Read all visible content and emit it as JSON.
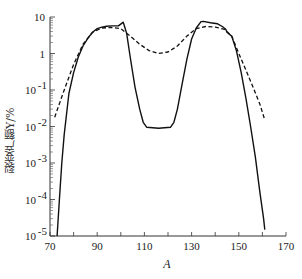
{
  "chart_data": {
    "type": "line",
    "title": "",
    "xlabel": "A",
    "ylabel": "裂变产额Y/%",
    "xlim": [
      70,
      170
    ],
    "ylim": [
      1e-05,
      10
    ],
    "yscale": "log",
    "grid": false,
    "legend": null,
    "x_ticks": [
      70,
      80,
      90,
      100,
      110,
      120,
      130,
      140,
      150,
      160,
      170
    ],
    "x_tick_labels": [
      "70",
      "90",
      "110",
      "130",
      "150",
      "170"
    ],
    "y_tick_labels": [
      "10",
      "1",
      "10⁻¹",
      "10⁻²",
      "10⁻³",
      "10⁻⁴",
      "10⁻⁵"
    ],
    "series": [
      {
        "name": "solid",
        "style": "solid",
        "x": [
          73,
          74,
          75,
          76,
          78,
          80,
          82,
          84,
          86,
          88,
          90,
          92,
          94,
          96,
          99,
          100.5,
          101,
          101.6,
          102.5,
          104,
          106,
          108,
          109.5,
          111,
          116,
          121,
          122.5,
          124,
          126,
          128,
          130,
          132,
          134,
          135,
          138,
          141,
          143,
          144.5,
          145,
          147,
          149,
          151,
          153,
          155,
          157,
          159,
          160.5,
          161
        ],
        "y": [
          1e-05,
          0.0001,
          0.001,
          0.006,
          0.08,
          0.3,
          0.8,
          1.6,
          2.6,
          3.8,
          4.8,
          5.3,
          5.6,
          5.7,
          5.7,
          6.8,
          7.2,
          5.5,
          3.5,
          0.8,
          0.12,
          0.03,
          0.013,
          0.0095,
          0.009,
          0.0095,
          0.013,
          0.03,
          0.15,
          0.7,
          2.5,
          5.0,
          7.5,
          7.6,
          7.0,
          6.5,
          5.5,
          4.6,
          3.8,
          3.0,
          1.2,
          0.3,
          0.06,
          0.01,
          0.0015,
          0.00015,
          3e-05,
          1.5e-05
        ]
      },
      {
        "name": "dashed",
        "style": "dashed",
        "x": [
          72,
          76,
          80,
          84,
          88,
          92,
          96,
          100,
          104,
          108,
          112,
          116,
          120,
          124,
          128,
          132,
          136,
          140,
          144,
          147,
          150,
          153,
          156,
          159,
          161
        ],
        "y": [
          0.018,
          0.1,
          0.5,
          1.8,
          3.8,
          5.0,
          5.2,
          4.8,
          3.0,
          1.8,
          1.2,
          1.0,
          1.1,
          1.6,
          3.0,
          4.8,
          5.5,
          5.3,
          4.6,
          3.0,
          1.0,
          0.35,
          0.12,
          0.04,
          0.015
        ]
      }
    ]
  }
}
